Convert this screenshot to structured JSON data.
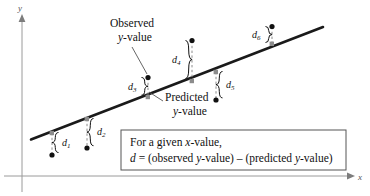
{
  "figure": {
    "axes": {
      "x_label": "x",
      "y_label": "y",
      "x_axis_color": "#9a9a9a",
      "y_axis_color": "#9a9a9a"
    },
    "regression_line": {
      "color": "#1a1a1a",
      "label": "regression-line"
    },
    "annotations": {
      "observed_line1": "Observed",
      "observed_line2_ital": "y",
      "observed_line2_rest": "-value",
      "predicted_line1": "Predicted",
      "predicted_line2_ital": "y",
      "predicted_line2_rest": "-value"
    },
    "callout_box": {
      "line1_pre": "For a given ",
      "line1_ital": "x",
      "line1_post": "-value,",
      "line2_d": "d",
      "line2_eq": " = (observed ",
      "line2_y1": "y",
      "line2_mid": "-value) – (predicted ",
      "line2_y2": "y",
      "line2_end": "-value)",
      "border_color": "#555555"
    },
    "residuals": [
      {
        "name": "d1",
        "letter": "d",
        "sub": "1",
        "label_x": 66,
        "label_y": 145,
        "brace_x": 58,
        "brace_top": 133,
        "brace_bottom": 155,
        "line_x": 52,
        "pred_y": 133,
        "obs_y": 155,
        "brace_dir": "right",
        "point_side": "below"
      },
      {
        "name": "d2",
        "letter": "d",
        "sub": "2",
        "label_x": 101,
        "label_y": 134,
        "brace_x": 93,
        "brace_top": 119,
        "brace_bottom": 148,
        "line_x": 87,
        "pred_y": 119,
        "obs_y": 148,
        "brace_dir": "right",
        "point_side": "below"
      },
      {
        "name": "d3",
        "letter": "d",
        "sub": "3",
        "label_x": 131,
        "label_y": 87,
        "brace_x": 142,
        "brace_top": 77,
        "brace_bottom": 97,
        "line_x": 148,
        "pred_y": 97,
        "obs_y": 77,
        "brace_dir": "left",
        "point_side": "above"
      },
      {
        "name": "d4",
        "letter": "d",
        "sub": "4",
        "label_x": 175,
        "label_y": 60,
        "brace_x": 186,
        "brace_top": 40,
        "brace_bottom": 81,
        "line_x": 192,
        "pred_y": 81,
        "obs_y": 40,
        "brace_dir": "left",
        "point_side": "above"
      },
      {
        "name": "d5",
        "letter": "d",
        "sub": "5",
        "label_x": 230,
        "label_y": 87,
        "brace_x": 222,
        "brace_top": 72,
        "brace_bottom": 100,
        "line_x": 216,
        "pred_y": 72,
        "obs_y": 100,
        "brace_dir": "right",
        "point_side": "below"
      },
      {
        "name": "d6",
        "letter": "d",
        "sub": "6",
        "label_x": 255,
        "label_y": 37,
        "brace_x": 266,
        "brace_top": 26,
        "brace_bottom": 43,
        "line_x": 272,
        "pred_y": 43,
        "obs_y": 26,
        "brace_dir": "left",
        "point_side": "above"
      }
    ]
  }
}
